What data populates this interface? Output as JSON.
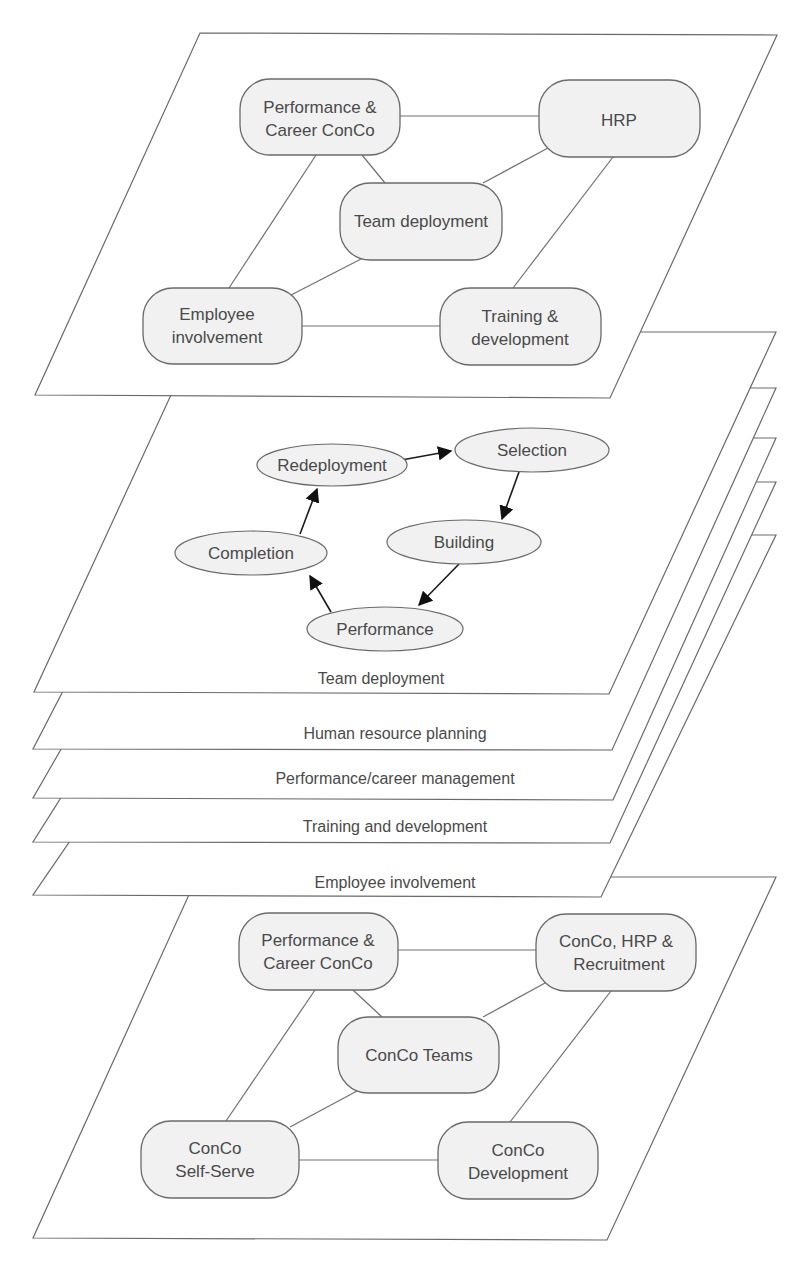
{
  "top_plane": {
    "nodes": {
      "perf_career": {
        "line1": "Performance &",
        "line2": "Career ConCo"
      },
      "hrp": {
        "label": "HRP"
      },
      "team_deployment": {
        "label": "Team deployment"
      },
      "employee": {
        "line1": "Employee",
        "line2": "involvement"
      },
      "training": {
        "line1": "Training &",
        "line2": "development"
      }
    }
  },
  "team_plane": {
    "label": "Team deployment",
    "cycle": {
      "redeployment": "Redeployment",
      "selection": "Selection",
      "building": "Building",
      "performance": "Performance",
      "completion": "Completion"
    }
  },
  "stack_planes": [
    {
      "label": "Human resource planning"
    },
    {
      "label": "Performance/career management"
    },
    {
      "label": "Training and development"
    },
    {
      "label": "Employee involvement"
    }
  ],
  "bottom_plane": {
    "nodes": {
      "perf_career": {
        "line1": "Performance &",
        "line2": "Career ConCo"
      },
      "conco_hrp": {
        "line1": "ConCo, HRP &",
        "line2": "Recruitment"
      },
      "conco_teams": {
        "label": "ConCo Teams"
      },
      "self_serve": {
        "line1": "ConCo",
        "line2": "Self-Serve"
      },
      "development": {
        "line1": "ConCo",
        "line2": "Development"
      }
    }
  }
}
